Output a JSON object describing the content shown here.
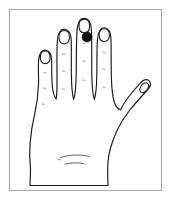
{
  "figure": {
    "subject": "hand",
    "view": "dorsal",
    "side": "left",
    "alt_text": "Line drawing of the back of a hand with a dark pigmented spot on the middle finger",
    "border_color": "#a8a8a8",
    "background_color": "#ffffff",
    "outline_color": "#1a1a1a",
    "marker_color": "#111111",
    "faint_detail_color": "#8c8c8c"
  },
  "annotations": {
    "lesion": {
      "label": "pigmented-lesion",
      "location": "middle finger distal phalanx",
      "shape": "filled-circle",
      "color": "#111111",
      "center_x": 87,
      "center_y": 37,
      "radius": 5
    }
  },
  "parts": {
    "digits": [
      {
        "name": "thumb",
        "label": "Thumb",
        "has_nail": true,
        "marked": false
      },
      {
        "name": "index-finger",
        "label": "Index finger",
        "has_nail": true,
        "marked": false
      },
      {
        "name": "middle-finger",
        "label": "Middle finger",
        "has_nail": true,
        "marked": true
      },
      {
        "name": "ring-finger",
        "label": "Ring finger",
        "has_nail": true,
        "marked": false
      },
      {
        "name": "little-finger",
        "label": "Little finger",
        "has_nail": true,
        "marked": false
      }
    ],
    "other": [
      {
        "name": "dorsum",
        "label": "Back of hand"
      },
      {
        "name": "wrist-creases",
        "label": "Wrist creases"
      }
    ]
  }
}
